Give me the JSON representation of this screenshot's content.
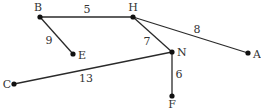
{
  "graph": {
    "type": "weighted-undirected-graph",
    "nodes": [
      {
        "id": "B",
        "label": "B",
        "x": 40,
        "y": 17,
        "lx": 38,
        "ly": 11,
        "anchor": "middle"
      },
      {
        "id": "H",
        "label": "H",
        "x": 133,
        "y": 17,
        "lx": 133,
        "ly": 11,
        "anchor": "middle"
      },
      {
        "id": "E",
        "label": "E",
        "x": 73,
        "y": 54,
        "lx": 78,
        "ly": 59,
        "anchor": "start"
      },
      {
        "id": "N",
        "label": "N",
        "x": 172,
        "y": 52,
        "lx": 177,
        "ly": 56,
        "anchor": "start"
      },
      {
        "id": "A",
        "label": "A",
        "x": 248,
        "y": 53,
        "lx": 253,
        "ly": 58,
        "anchor": "start"
      },
      {
        "id": "C",
        "label": "C",
        "x": 14,
        "y": 84,
        "lx": 7,
        "ly": 88,
        "anchor": "middle"
      },
      {
        "id": "F",
        "label": "F",
        "x": 172,
        "y": 96,
        "lx": 172,
        "ly": 108,
        "anchor": "middle"
      }
    ],
    "edges": [
      {
        "from": "B",
        "to": "H",
        "weight": "5",
        "lx": 87,
        "ly": 13
      },
      {
        "from": "B",
        "to": "E",
        "weight": "9",
        "lx": 49,
        "ly": 44
      },
      {
        "from": "H",
        "to": "A",
        "weight": "8",
        "lx": 197,
        "ly": 33
      },
      {
        "from": "H",
        "to": "N",
        "weight": "7",
        "lx": 147,
        "ly": 45
      },
      {
        "from": "C",
        "to": "N",
        "weight": "13",
        "lx": 86,
        "ly": 82
      },
      {
        "from": "N",
        "to": "F",
        "weight": "6",
        "lx": 179,
        "ly": 78
      }
    ]
  }
}
